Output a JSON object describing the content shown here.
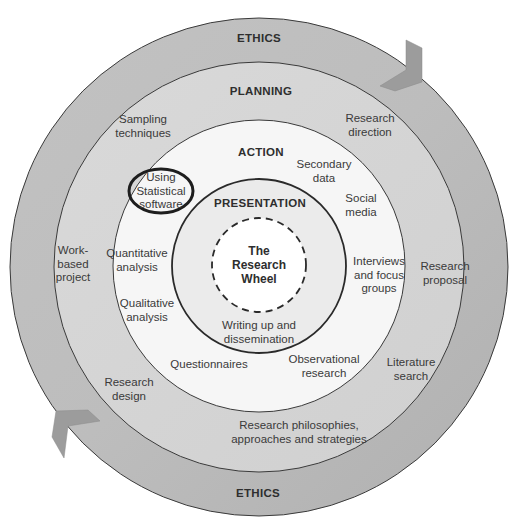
{
  "diagram": {
    "title": "The Research Wheel",
    "center": {
      "label": "The\nResearch\nWheel"
    },
    "colors": {
      "ethics_ring": "#b9b9b9",
      "planning_ring": "#d6d6d6",
      "action_ring": "#f6f6f6",
      "presentation_ring": "#ebebeb",
      "center": "#ffffff",
      "arrow": "#9c9c9c",
      "stroke": "#3a3a3a"
    },
    "rings": {
      "ethics": {
        "title_top": "ETHICS",
        "title_bottom": "ETHICS"
      },
      "planning": {
        "title": "PLANNING",
        "items": [
          "Sampling\ntechniques",
          "Research\ndirection",
          "Work-\nbased\nproject",
          "Research\nproposal",
          "Research\ndesign",
          "Literature\nsearch",
          "Research philosophies,\napproaches and strategies"
        ]
      },
      "action": {
        "title": "ACTION",
        "items": [
          "Using\nStatistical\nsoftware",
          "Secondary\ndata",
          "Social\nmedia",
          "Quantitative\nanalysis",
          "Interviews\nand focus\ngroups",
          "Qualitative\nanalysis",
          "Questionnaires",
          "Observational\nresearch"
        ]
      },
      "presentation": {
        "title": "PRESENTATION",
        "items": [
          "Writing up and\ndissemination"
        ]
      }
    },
    "highlighted_item": "Using\nStatistical\nsoftware"
  }
}
